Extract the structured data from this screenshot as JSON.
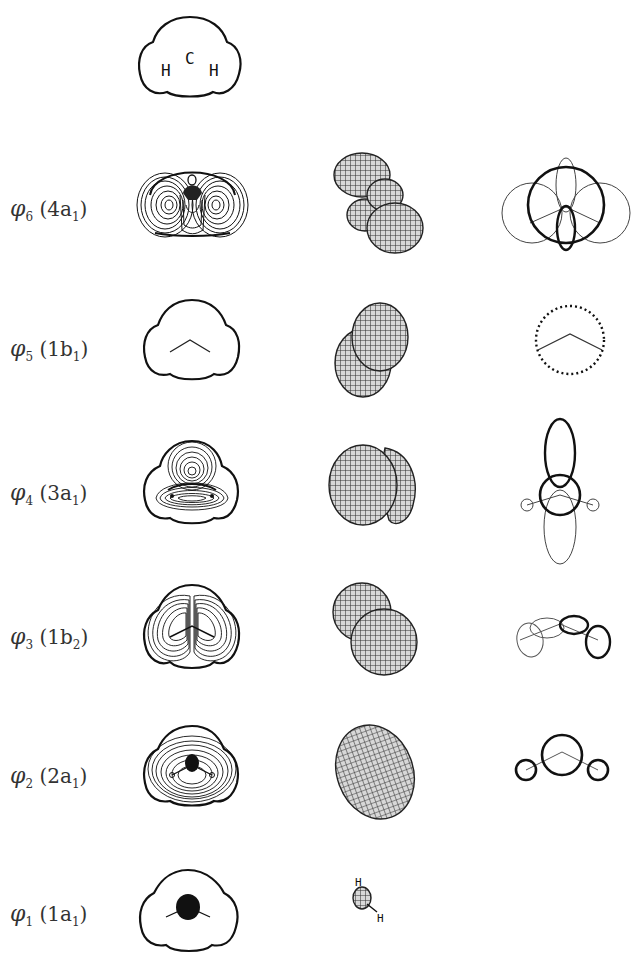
{
  "figure": {
    "molecule": "CH2",
    "header_contour": {
      "atoms": [
        "H",
        "C",
        "H"
      ]
    },
    "columns": [
      "contour-map",
      "3d-mesh-surface",
      "lcao-lobe-diagram"
    ],
    "rows": [
      {
        "orbital": "φ",
        "index": "6",
        "symmetry": "4a",
        "sym_sub": "1",
        "text": "φ6 (4a1)"
      },
      {
        "orbital": "φ",
        "index": "5",
        "symmetry": "1b",
        "sym_sub": "1",
        "text": "φ5 (1b1)"
      },
      {
        "orbital": "φ",
        "index": "4",
        "symmetry": "3a",
        "sym_sub": "1",
        "text": "φ4 (3a1)"
      },
      {
        "orbital": "φ",
        "index": "3",
        "symmetry": "1b",
        "sym_sub": "2",
        "text": "φ3 (1b2)"
      },
      {
        "orbital": "φ",
        "index": "2",
        "symmetry": "2a",
        "sym_sub": "1",
        "text": "φ2 (2a1)"
      },
      {
        "orbital": "φ",
        "index": "1",
        "symmetry": "1a",
        "sym_sub": "1",
        "text": "φ1 (1a1)"
      }
    ],
    "mesh_atom_labels": [
      "H",
      "C",
      "H"
    ]
  }
}
